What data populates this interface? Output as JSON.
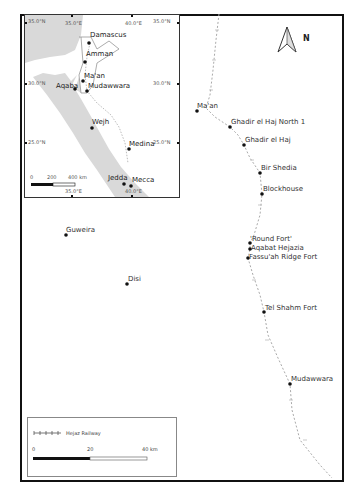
{
  "main_map": {
    "north_label": "N",
    "places": [
      {
        "name": "Ma'an",
        "x": 197,
        "y": 111
      },
      {
        "name": "Ghadir el Haj North 1",
        "x": 230,
        "y": 127
      },
      {
        "name": "Ghadir el Haj",
        "x": 244,
        "y": 145
      },
      {
        "name": "Bir Shedia",
        "x": 260,
        "y": 173
      },
      {
        "name": "Blockhouse",
        "x": 262,
        "y": 194
      },
      {
        "name": "'Round Fort'",
        "x": 250,
        "y": 243
      },
      {
        "name": "Aqabat Hejazia",
        "x": 250,
        "y": 249
      },
      {
        "name": "Fassu'ah Ridge Fort",
        "x": 248,
        "y": 258
      },
      {
        "name": "Tel Shahm Fort",
        "x": 264,
        "y": 312
      },
      {
        "name": "Mudawwara",
        "x": 290,
        "y": 384
      },
      {
        "name": "Guweira",
        "x": 66,
        "y": 235
      },
      {
        "name": "Disi",
        "x": 127,
        "y": 284
      }
    ],
    "labels": {
      "maan": "Ma'an",
      "ghadir_north": "Ghadir el Haj North 1",
      "ghadir": "Ghadir el Haj",
      "bir_shedia": "Bir Shedia",
      "blockhouse": "Blockhouse",
      "round_fort": "'Round Fort'",
      "aqabat": "Aqabat Hejazia",
      "fassuah": "Fassu'ah Ridge Fort",
      "tel_shahm": "Tel Shahm Fort",
      "mudawwara": "Mudawwara",
      "guweira": "Guweira",
      "disi": "Disi"
    }
  },
  "inset_map": {
    "places": {
      "damascus": "Damascus",
      "amman": "Amman",
      "maan": "Ma'an",
      "aqaba": "Aqaba",
      "mudawwara": "Mudawwara",
      "wejh": "Wejh",
      "medina": "Medina",
      "jedda": "Jedda",
      "mecca": "Mecca"
    },
    "ticks": {
      "lat_35_left": "35.0°N",
      "lat_35_right": "35.0°N",
      "lat_30_left": "30.0°N",
      "lat_30_right": "30.0°N",
      "lat_25_left": "25.0°N",
      "lat_25_right": "25.0°N",
      "lon_35_top": "35.0°E",
      "lon_40_top": "40.0°E",
      "lon_35_bottom": "35.0°E",
      "lon_40_bottom": "40.0°E"
    },
    "scale": {
      "l0": "0",
      "l200": "200",
      "l400": "400 km"
    }
  },
  "legend": {
    "railway_label": "Hejaz Railway",
    "scale": {
      "l0": "0",
      "l20": "20",
      "l40": "40 km"
    }
  },
  "colors": {
    "sea": "#d9d9d9",
    "railway": "#aaaaaa",
    "frame": "#111111",
    "point": "#111111"
  }
}
